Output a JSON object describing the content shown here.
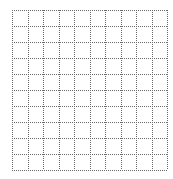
{
  "grid": {
    "rows": 10,
    "cols": 10,
    "left": 12,
    "top": 10,
    "width": 155,
    "height": 160,
    "line_color": "#6a6a6a",
    "line_style": "dotted",
    "background": "#ffffff"
  }
}
